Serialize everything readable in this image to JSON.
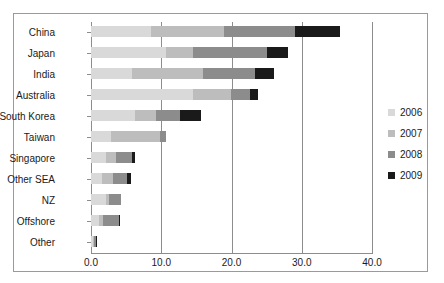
{
  "chart_data": {
    "type": "bar",
    "orientation": "horizontal",
    "stacked": true,
    "title": "",
    "xlabel": "",
    "ylabel": "",
    "xlim": [
      0.0,
      40.0
    ],
    "xticks": [
      "0.0",
      "10.0",
      "20.0",
      "30.0",
      "40.0"
    ],
    "xtick_values": [
      0.0,
      10.0,
      20.0,
      30.0,
      40.0
    ],
    "grid": true,
    "grid_axis": "x",
    "legend_position": "right",
    "categories": [
      "China",
      "Japan",
      "India",
      "Australia",
      "South Korea",
      "Taiwan",
      "Singapore",
      "Other SEA",
      "NZ",
      "Offshore",
      "Other"
    ],
    "series": [
      {
        "name": "2006",
        "color": "#d9d9d9",
        "values": [
          8.5,
          10.7,
          5.8,
          14.5,
          6.3,
          2.9,
          2.1,
          1.6,
          2.2,
          1.1,
          0.3
        ]
      },
      {
        "name": "2007",
        "color": "#bdbdbd",
        "values": [
          10.5,
          3.8,
          10.2,
          5.5,
          2.9,
          6.9,
          1.5,
          1.6,
          0.4,
          0.6,
          0.2
        ]
      },
      {
        "name": "2008",
        "color": "#8c8c8c",
        "values": [
          10.0,
          10.5,
          7.3,
          2.7,
          3.5,
          0.9,
          2.2,
          1.9,
          1.7,
          2.3,
          0.2
        ]
      },
      {
        "name": "2009",
        "color": "#1a1a1a",
        "values": [
          6.5,
          3.0,
          2.7,
          1.1,
          2.9,
          0.0,
          0.5,
          0.6,
          0.0,
          0.2,
          0.2
        ]
      }
    ],
    "totals": [
      35.5,
      28.0,
      26.0,
      23.8,
      15.6,
      10.7,
      6.3,
      5.7,
      4.3,
      4.2,
      0.9
    ]
  },
  "legend": {
    "items": [
      {
        "label": "2006",
        "color": "#d9d9d9"
      },
      {
        "label": "2007",
        "color": "#bdbdbd"
      },
      {
        "label": "2008",
        "color": "#8c8c8c"
      },
      {
        "label": "2009",
        "color": "#1a1a1a"
      }
    ]
  },
  "colors": {
    "frame": "#9a9a9a",
    "axis": "#8d8d8d",
    "grid": "#8d8d8d",
    "text": "#1a1a1a",
    "background": "#ffffff"
  }
}
